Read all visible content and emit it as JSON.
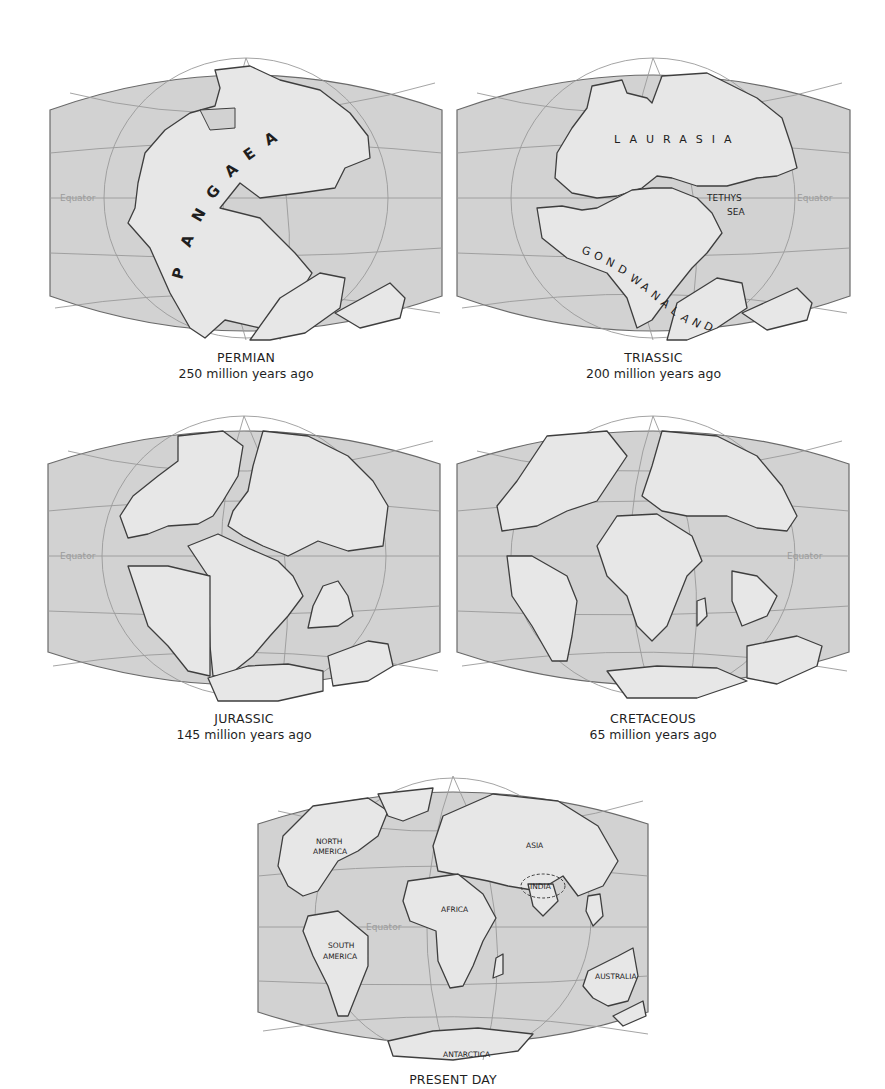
{
  "figure": {
    "type": "continental-drift-sequence",
    "panels": [
      {
        "id": "permian",
        "title": "PERMIAN",
        "subtitle": "250 million years ago",
        "equator_label": "Equator",
        "map_labels": [
          "PANGAEA"
        ]
      },
      {
        "id": "triassic",
        "title": "TRIASSIC",
        "subtitle": "200 million years ago",
        "equator_label": "Equator",
        "map_labels": [
          "LAURASIA",
          "TETHYS",
          "SEA",
          "GONDWANALAND"
        ]
      },
      {
        "id": "jurassic",
        "title": "JURASSIC",
        "subtitle": "145 million years ago",
        "equator_label": "Equator",
        "map_labels": []
      },
      {
        "id": "cretaceous",
        "title": "CRETACEOUS",
        "subtitle": "65 million years ago",
        "equator_label": "Equator",
        "map_labels": []
      },
      {
        "id": "present",
        "title": "PRESENT DAY",
        "subtitle": "",
        "equator_label": "Equator",
        "map_labels": [
          "NORTH",
          "AMERICA",
          "ASIA",
          "INDIA",
          "AFRICA",
          "SOUTH",
          "AMERICA",
          "AUSTRALIA",
          "ANTARCTICA"
        ]
      }
    ],
    "pangaea_letters": [
      "P",
      "A",
      "N",
      "G",
      "A",
      "E",
      "A"
    ],
    "gondwana_letters": [
      "G",
      "O",
      "N",
      "D",
      "W",
      "A",
      "N",
      "A",
      "L",
      "A",
      "N",
      "D"
    ],
    "colors": {
      "ocean": "#d2d2d2",
      "land": "#e7e7e7",
      "coastline": "#3e3e3e",
      "grid": "#9a9a9a",
      "equator_text": "#9c9c9c",
      "background": "#ffffff"
    }
  }
}
